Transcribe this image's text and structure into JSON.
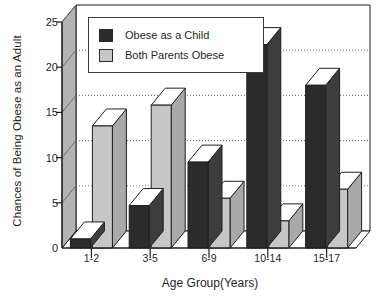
{
  "chart_data": {
    "type": "bar",
    "title": "",
    "xlabel": "Age Group(Years)",
    "ylabel": "Chances of Being Obese as an Adult",
    "categories": [
      "1-2",
      "3-5",
      "6-9",
      "10-14",
      "15-17"
    ],
    "series": [
      {
        "name": "Obese as a Child",
        "color": "#2b2b2b",
        "values": [
          1,
          4.7,
          9.5,
          22.5,
          18
        ]
      },
      {
        "name": "Both Parents Obese",
        "color": "#c4c4c4",
        "values": [
          13.5,
          15.8,
          5.5,
          3,
          6.5
        ]
      }
    ],
    "ylim": [
      0,
      25
    ],
    "yticks": [
      0,
      5,
      10,
      15,
      20,
      25
    ],
    "ytick_labels": [
      "0",
      "5",
      "10",
      "15",
      "20",
      "25"
    ],
    "grid": true,
    "grid_axis": "y",
    "legend_position": "upper-left-inside",
    "style": "3d-bars"
  },
  "legend": {
    "items": [
      {
        "label": "Obese as a Child",
        "swatch": "#2b2b2b"
      },
      {
        "label": "Both Parents Obese",
        "swatch": "#c4c4c4"
      }
    ]
  },
  "colors": {
    "dark_bar_front": "#2b2b2b",
    "dark_bar_side": "#3d3d3d",
    "dark_bar_top": "#ffffff",
    "light_bar_front": "#c6c6c6",
    "light_bar_side": "#a9a9a9",
    "light_bar_top": "#ffffff",
    "wall": "#ffffff",
    "axis_wall": "#b3b3b3",
    "grid": "#6e6e6e",
    "outline": "#1f1f1f"
  }
}
